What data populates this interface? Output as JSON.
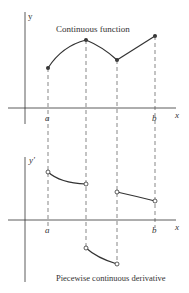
{
  "top_plot": {
    "axis_y_label": "y",
    "axis_x_label": "x",
    "title": "Continuous function",
    "tick_a": "a",
    "tick_b": "b"
  },
  "bottom_plot": {
    "axis_y_label": "y'",
    "axis_x_label": "x",
    "title": "Piecewise continuous derivative",
    "tick_a": "a",
    "tick_b": "b"
  },
  "colors": {
    "ink": "#333333",
    "dash": "#555555"
  }
}
